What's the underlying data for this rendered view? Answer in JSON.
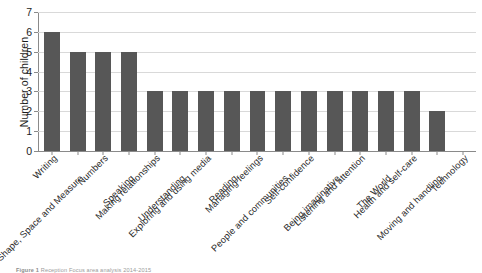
{
  "chart_data": {
    "type": "bar",
    "title": "",
    "xlabel": "",
    "ylabel": "Number of children",
    "ylim": [
      0,
      7
    ],
    "yticks": [
      0,
      1,
      2,
      3,
      4,
      5,
      6,
      7
    ],
    "grid": true,
    "legend": false,
    "bar_color": "#575757",
    "gridline_color": "#d9d9d9",
    "axis_color": "#8a8a8a",
    "categories": [
      "Writing",
      "Shape, Space and Measure",
      "Numbers",
      "Speaking",
      "Making relationships",
      "Understanding",
      "Exploring and using media",
      "Reading",
      "Managing feelings",
      "People and communities",
      "Self-confidence",
      "Being imaginative",
      "Listening and attention",
      "The World",
      "Health and self-care",
      "Moving and handling",
      "Technology"
    ],
    "values": [
      6,
      5,
      5,
      5,
      3,
      3,
      3,
      3,
      3,
      3,
      3,
      3,
      3,
      3,
      3,
      2,
      0
    ]
  },
  "caption": {
    "label": "Figure 1",
    "text": "Reception Focus area analysis 2014-2015"
  }
}
